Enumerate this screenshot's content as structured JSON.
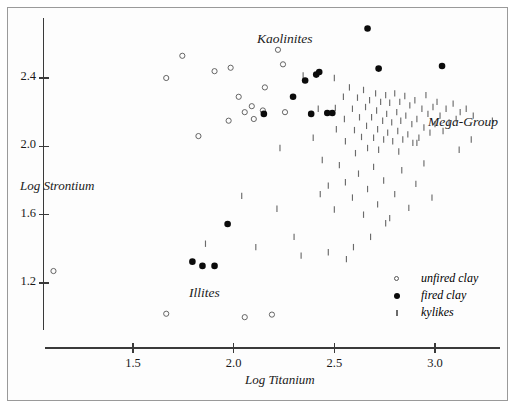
{
  "figure": {
    "width": 517,
    "height": 413,
    "background": "#ffffff",
    "frame_color": "#9a9a9a"
  },
  "chart_data": {
    "type": "scatter",
    "title": "",
    "xlabel": "Log Titanium",
    "ylabel": "Log Strontium",
    "xlim": [
      1.05,
      3.38
    ],
    "ylim": [
      0.93,
      2.72
    ],
    "xticks": [
      1.5,
      2.0,
      2.5,
      3.0
    ],
    "xtick_labels": [
      "1.5",
      "2.0",
      "2.5",
      "3.0"
    ],
    "yticks": [
      1.2,
      1.6,
      2.0,
      2.4
    ],
    "ytick_labels": [
      "1.2",
      "1.6",
      "2.0",
      "2.4"
    ],
    "grid": false,
    "legend_position": "bottom-right",
    "annotations": [
      {
        "text": "Kaolinites",
        "x": 2.33,
        "y": 2.62
      },
      {
        "text": "Illites",
        "x": 1.93,
        "y": 1.22
      },
      {
        "text": "Mega-Group",
        "x": 2.99,
        "y": 2.12
      }
    ],
    "series": [
      {
        "name": "unfired clay",
        "marker": "open-circle",
        "color": "#555555",
        "points": [
          [
            1.105,
            1.27
          ],
          [
            1.665,
            2.4
          ],
          [
            1.665,
            1.02
          ],
          [
            1.745,
            2.53
          ],
          [
            1.825,
            2.06
          ],
          [
            1.905,
            2.44
          ],
          [
            1.975,
            2.15
          ],
          [
            1.985,
            2.46
          ],
          [
            2.025,
            2.29
          ],
          [
            2.055,
            2.2
          ],
          [
            2.055,
            1.0
          ],
          [
            2.09,
            2.235
          ],
          [
            2.1,
            2.16
          ],
          [
            2.145,
            2.21
          ],
          [
            2.155,
            2.345
          ],
          [
            2.19,
            1.015
          ],
          [
            2.22,
            2.565
          ],
          [
            2.245,
            2.48
          ],
          [
            2.255,
            2.2
          ]
        ]
      },
      {
        "name": "fired clay",
        "marker": "filled-circle",
        "color": "#0b0b0b",
        "points": [
          [
            1.795,
            1.325
          ],
          [
            1.845,
            1.3
          ],
          [
            1.905,
            1.3
          ],
          [
            1.97,
            1.545
          ],
          [
            2.15,
            2.19
          ],
          [
            2.295,
            2.29
          ],
          [
            2.355,
            2.385
          ],
          [
            2.41,
            2.42
          ],
          [
            2.425,
            2.435
          ],
          [
            2.385,
            2.19
          ],
          [
            2.465,
            2.195
          ],
          [
            2.49,
            2.195
          ],
          [
            2.665,
            2.69
          ],
          [
            2.72,
            2.455
          ],
          [
            3.035,
            2.47
          ]
        ]
      },
      {
        "name": "kylikes",
        "marker": "vertical-tick",
        "color": "#6b6b6b",
        "points": [
          [
            2.345,
            2.415
          ],
          [
            2.395,
            2.05
          ],
          [
            2.43,
            1.72
          ],
          [
            2.5,
            2.4
          ],
          [
            2.505,
            2.225
          ],
          [
            2.51,
            2.1
          ],
          [
            2.545,
            2.29
          ],
          [
            2.55,
            2.16
          ],
          [
            2.555,
            2.03
          ],
          [
            2.575,
            2.345
          ],
          [
            2.59,
            2.22
          ],
          [
            2.6,
            2.095
          ],
          [
            2.605,
            1.96
          ],
          [
            2.615,
            2.285
          ],
          [
            2.625,
            2.17
          ],
          [
            2.635,
            2.055
          ],
          [
            2.645,
            2.33
          ],
          [
            2.655,
            2.23
          ],
          [
            2.66,
            2.12
          ],
          [
            2.665,
            1.99
          ],
          [
            2.675,
            2.27
          ],
          [
            2.685,
            2.17
          ],
          [
            2.695,
            2.05
          ],
          [
            2.705,
            2.31
          ],
          [
            2.71,
            2.21
          ],
          [
            2.715,
            2.1
          ],
          [
            2.72,
            1.98
          ],
          [
            2.73,
            2.26
          ],
          [
            2.74,
            2.15
          ],
          [
            2.745,
            2.04
          ],
          [
            2.755,
            2.3
          ],
          [
            2.76,
            2.19
          ],
          [
            2.765,
            2.08
          ],
          [
            2.775,
            2.255
          ],
          [
            2.785,
            2.14
          ],
          [
            2.79,
            2.03
          ],
          [
            2.8,
            2.31
          ],
          [
            2.81,
            2.2
          ],
          [
            2.815,
            2.09
          ],
          [
            2.825,
            2.26
          ],
          [
            2.83,
            2.15
          ],
          [
            2.84,
            2.04
          ],
          [
            2.85,
            2.295
          ],
          [
            2.855,
            2.18
          ],
          [
            2.865,
            2.07
          ],
          [
            2.875,
            2.24
          ],
          [
            2.885,
            2.13
          ],
          [
            2.89,
            2.02
          ],
          [
            2.9,
            2.27
          ],
          [
            2.91,
            2.16
          ],
          [
            2.92,
            2.05
          ],
          [
            2.935,
            2.22
          ],
          [
            2.945,
            2.11
          ],
          [
            2.955,
            2.3
          ],
          [
            2.965,
            2.19
          ],
          [
            2.975,
            2.08
          ],
          [
            2.99,
            2.23
          ],
          [
            3.0,
            2.13
          ],
          [
            3.01,
            2.26
          ],
          [
            3.025,
            2.18
          ],
          [
            3.04,
            2.09
          ],
          [
            3.055,
            2.22
          ],
          [
            3.07,
            2.14
          ],
          [
            3.09,
            2.25
          ],
          [
            3.105,
            2.16
          ],
          [
            3.125,
            2.2
          ],
          [
            3.155,
            2.22
          ],
          [
            3.19,
            2.18
          ],
          [
            3.285,
            2.15
          ],
          [
            2.525,
            1.89
          ],
          [
            2.555,
            1.79
          ],
          [
            2.59,
            1.7
          ],
          [
            2.62,
            1.84
          ],
          [
            2.645,
            1.6
          ],
          [
            2.665,
            1.75
          ],
          [
            2.695,
            1.88
          ],
          [
            2.715,
            1.66
          ],
          [
            2.745,
            1.8
          ],
          [
            2.775,
            1.58
          ],
          [
            2.8,
            1.72
          ],
          [
            2.835,
            1.86
          ],
          [
            2.87,
            1.64
          ],
          [
            2.905,
            1.78
          ],
          [
            2.945,
            1.9
          ],
          [
            2.985,
            1.7
          ],
          [
            2.5,
            1.63
          ],
          [
            2.47,
            1.77
          ],
          [
            2.44,
            1.92
          ],
          [
            2.42,
            2.22
          ],
          [
            2.3,
            1.47
          ],
          [
            2.23,
            1.99
          ],
          [
            2.11,
            1.41
          ],
          [
            1.86,
            1.43
          ],
          [
            2.04,
            1.71
          ],
          [
            2.215,
            1.635
          ],
          [
            2.595,
            1.41
          ],
          [
            2.68,
            1.47
          ],
          [
            2.755,
            1.55
          ],
          [
            2.56,
            1.34
          ],
          [
            2.47,
            1.38
          ],
          [
            2.335,
            1.36
          ],
          [
            3.12,
            1.98
          ],
          [
            2.82,
            1.97
          ],
          [
            2.91,
            2.02
          ],
          [
            3.18,
            2.04
          ]
        ]
      }
    ]
  },
  "axes": {
    "y_label": "Log Strontium",
    "x_label": "Log Titanium",
    "x_tick_labels": [
      "1.5",
      "2.0",
      "2.5",
      "3.0"
    ],
    "y_tick_labels": [
      "1.2",
      "1.6",
      "2.0",
      "2.4"
    ]
  },
  "labels": {
    "kaolinites": "Kaolinites",
    "illites": "Illites",
    "mega_group": "Mega-Group"
  },
  "legend": {
    "items": [
      {
        "label": "unfired clay",
        "marker": "open-circle"
      },
      {
        "label": "fired clay",
        "marker": "filled-circle"
      },
      {
        "label": "kylikes",
        "marker": "vertical-tick"
      }
    ]
  }
}
